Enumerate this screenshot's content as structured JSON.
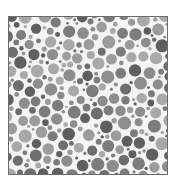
{
  "plate": {
    "background": "#f4f4f4",
    "border_color": "#6c6c6c",
    "colors": [
      "#5f5f5f",
      "#6e6e6e",
      "#7c7c7c",
      "#8d8d8d",
      "#9c9c9c",
      "#a9a9a9"
    ],
    "seed": 20240517,
    "width": 160,
    "height": 159,
    "radius_classes": [
      1.6,
      2.4,
      3.4,
      4.6,
      5.8
    ],
    "attempts": 9000
  }
}
